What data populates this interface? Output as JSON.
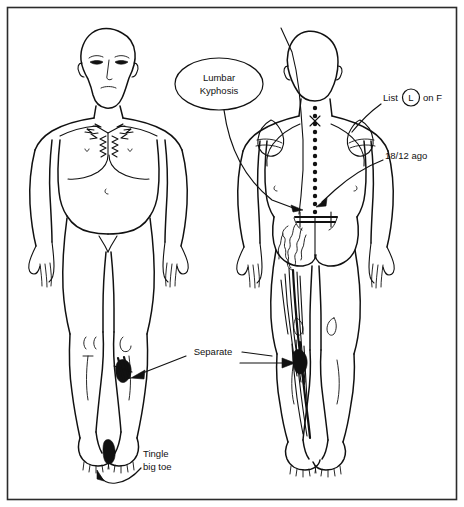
{
  "chart": {
    "frame_color": "#2b2b2b",
    "ink_color": "#111111",
    "background": "#ffffff"
  },
  "figures": [
    {
      "id": "anterior",
      "name": "anterior-body-figure",
      "view_label": "Anterior (front) view",
      "markings": [
        "zigzag pain lines radiating across sternum and chest",
        "dark filled patch on lateral left knee",
        "dark filled patch on left big toe"
      ]
    },
    {
      "id": "posterior",
      "name": "posterior-body-figure",
      "view_label": "Posterior (back) view",
      "markings": [
        "dotted line down cervical thoracic and lumbar spine",
        "cross mark at upper cervical spine",
        "horizontal level bar at lumbosacral junction",
        "scribble hatching over left buttock",
        "streaked hatching down posterior left thigh and calf",
        "plumb line from head to left shoulder"
      ]
    }
  ],
  "annotations": [
    {
      "id": "lumbar-kyphosis",
      "text_line_1": "Lumbar",
      "text_line_2": "Kyphosis",
      "shape": "ellipse",
      "points_to": "lumbar spine, posterior view"
    },
    {
      "id": "list-on-f",
      "text_before": "List",
      "circled_letter": "L",
      "text_after": "on F",
      "full_text": "List (L) on F",
      "points_to": "right shoulder / thoracic spine, posterior view"
    },
    {
      "id": "duration",
      "text": "18/12 ago",
      "points_to": "lumbosacral junction, posterior view"
    },
    {
      "id": "separate",
      "text": "Separate",
      "arrow_left_to": "left lateral knee, anterior view",
      "arrow_right_to": "posterior left thigh, posterior view"
    },
    {
      "id": "tingle-big-toe",
      "text_line_1": "Tingle",
      "text_line_2": "big toe",
      "points_to": "left big toe, anterior view"
    }
  ]
}
